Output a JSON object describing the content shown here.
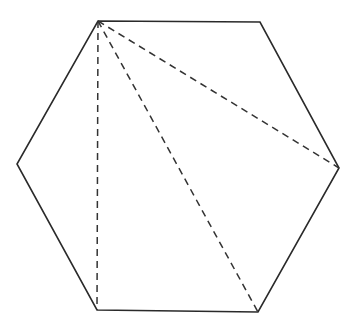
{
  "diagram": {
    "shape": "regular-hexagon",
    "stroke_color": "#2a2a2a",
    "dash_color": "#333333",
    "background": "#ffffff",
    "vertices": [
      {
        "name": "top-left",
        "x": 98,
        "y": 21
      },
      {
        "name": "top-right",
        "x": 260,
        "y": 22
      },
      {
        "name": "right",
        "x": 339,
        "y": 168
      },
      {
        "name": "bottom-right",
        "x": 258,
        "y": 312
      },
      {
        "name": "bottom-left",
        "x": 97,
        "y": 310
      },
      {
        "name": "left",
        "x": 17,
        "y": 164
      }
    ],
    "diagonals": [
      {
        "from": "top-left",
        "to": "bottom-left",
        "style": "dashed"
      },
      {
        "from": "top-left",
        "to": "bottom-right",
        "style": "dashed"
      },
      {
        "from": "top-left",
        "to": "right",
        "style": "dashed"
      }
    ]
  }
}
